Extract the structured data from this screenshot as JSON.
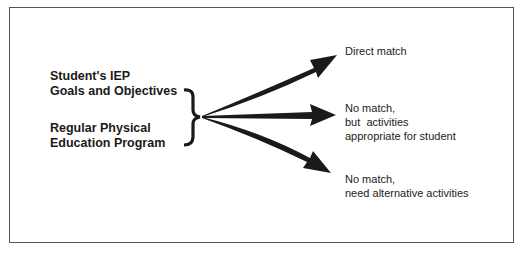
{
  "inputs": {
    "line1": "Student's IEP",
    "line2": "Goals and Objectives",
    "line3": "Regular Physical",
    "line4": "Education Program"
  },
  "outcomes": [
    {
      "line1": "Direct match",
      "line2": "",
      "line3": ""
    },
    {
      "line1": "No match,",
      "line2": "but  activities",
      "line3": "appropriate for student"
    },
    {
      "line1": "No match,",
      "line2": "need alternative activities",
      "line3": ""
    }
  ],
  "colors": {
    "arrow": "#1a1a1a",
    "border": "#555555",
    "text": "#222222"
  }
}
